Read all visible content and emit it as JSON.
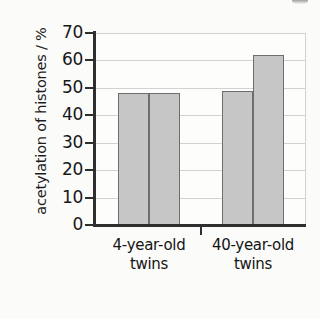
{
  "chart_data": {
    "type": "bar",
    "title": "",
    "xlabel": "",
    "ylabel": "acetylation of histones / %",
    "ylim": [
      0,
      70
    ],
    "yticks": [
      0,
      10,
      20,
      30,
      40,
      50,
      60,
      70
    ],
    "ytick_labels": [
      "0",
      "10",
      "20",
      "30",
      "40",
      "50",
      "60",
      "70"
    ],
    "grid": true,
    "legend": "none",
    "categories": [
      "4-year-old twins",
      "40-year-old twins"
    ],
    "category_lines": [
      {
        "line1": "4-year-old",
        "line2": "twins"
      },
      {
        "line1": "40-year-old",
        "line2": "twins"
      }
    ],
    "series": [
      {
        "name": "twin 1",
        "values": [
          48,
          49
        ]
      },
      {
        "name": "twin 2",
        "values": [
          48,
          62
        ]
      }
    ],
    "bars": [
      {
        "group": "4-year-old twins",
        "series": "twin 1",
        "value": 48
      },
      {
        "group": "4-year-old twins",
        "series": "twin 2",
        "value": 48
      },
      {
        "group": "40-year-old twins",
        "series": "twin 1",
        "value": 49
      },
      {
        "group": "40-year-old twins",
        "series": "twin 2",
        "value": 62
      }
    ],
    "colors": {
      "bar_fill": "#c6c6c6",
      "bar_border": "#6e6e6e",
      "axis": "#2f2f2f",
      "gridline": "#d2d2d2",
      "background": "#fbfbfa",
      "text": "#171717"
    }
  }
}
